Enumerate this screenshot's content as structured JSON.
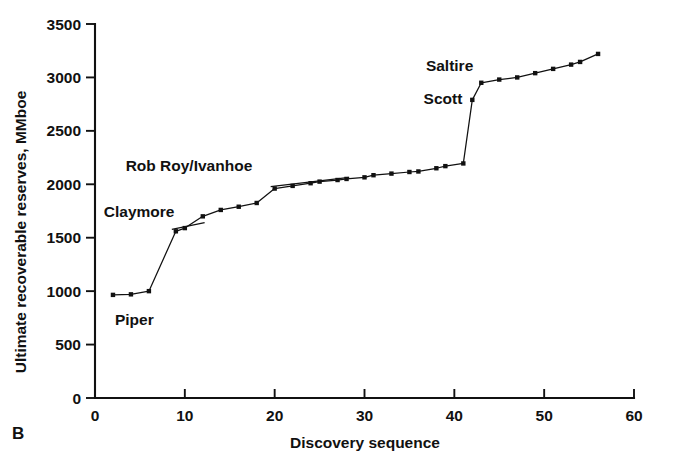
{
  "panel": {
    "label": "B"
  },
  "chart_data": {
    "type": "line",
    "title": "",
    "subtitle": "",
    "xlabel": "Discovery sequence",
    "ylabel": "Ultimate recoverable reserves, MMboe",
    "xlim": [
      0,
      60
    ],
    "ylim": [
      0,
      3500
    ],
    "xticks": [
      0,
      10,
      20,
      30,
      40,
      50,
      60
    ],
    "yticks": [
      0,
      500,
      1000,
      1500,
      2000,
      2500,
      3000,
      3500
    ],
    "grid": false,
    "legend": "none",
    "marker": "square",
    "series": [
      {
        "name": "Cumulative ultimate recoverable reserves",
        "x": [
          2,
          4,
          6,
          9,
          10,
          12,
          14,
          16,
          18,
          20,
          22,
          24,
          25,
          27,
          28,
          30,
          31,
          33,
          35,
          36,
          38,
          39,
          41,
          42,
          43,
          45,
          47,
          49,
          51,
          53,
          54,
          56
        ],
        "y": [
          965,
          970,
          1000,
          1560,
          1590,
          1700,
          1760,
          1790,
          1825,
          1960,
          1985,
          2010,
          2025,
          2040,
          2050,
          2065,
          2085,
          2100,
          2115,
          2120,
          2150,
          2170,
          2195,
          2790,
          2950,
          2980,
          3000,
          3040,
          3080,
          3120,
          3145,
          3220
        ]
      }
    ],
    "annotations": [
      {
        "text": "Piper",
        "value_x": 2,
        "value_y": 965
      },
      {
        "text": "Claymore",
        "value_x": 9,
        "value_y": 1560
      },
      {
        "text": "Rob Roy/Ivanhoe",
        "value_x": 20,
        "value_y": 1960
      },
      {
        "text": "Scott",
        "value_x": 42,
        "value_y": 2790
      },
      {
        "text": "Saltire",
        "value_x": 43,
        "value_y": 2950
      }
    ]
  }
}
